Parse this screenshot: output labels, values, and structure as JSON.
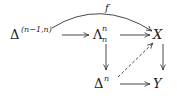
{
  "diagram": {
    "type": "commutative-diagram",
    "nodes": [
      {
        "id": "horn_boundary",
        "base": "Δ",
        "sup": "(n−1,n)",
        "sub": ""
      },
      {
        "id": "horn",
        "base": "Λ",
        "sup": "n",
        "sub": "n"
      },
      {
        "id": "X",
        "base": "X",
        "sup": "",
        "sub": ""
      },
      {
        "id": "simplex",
        "base": "Δ",
        "sup": "n",
        "sub": ""
      },
      {
        "id": "Y",
        "base": "Y",
        "sup": "",
        "sub": ""
      }
    ],
    "edges": [
      {
        "from": "horn_boundary",
        "to": "horn",
        "label": "",
        "style": "solid"
      },
      {
        "from": "horn",
        "to": "X",
        "label": "",
        "style": "solid"
      },
      {
        "from": "horn_boundary",
        "to": "X",
        "label": "f",
        "style": "curved"
      },
      {
        "from": "horn",
        "to": "simplex",
        "label": "",
        "style": "solid"
      },
      {
        "from": "X",
        "to": "Y",
        "label": "",
        "style": "solid"
      },
      {
        "from": "simplex",
        "to": "Y",
        "label": "",
        "style": "solid"
      },
      {
        "from": "simplex",
        "to": "X",
        "label": "",
        "style": "dashed"
      }
    ],
    "colors": {
      "ink": "#222222"
    }
  }
}
